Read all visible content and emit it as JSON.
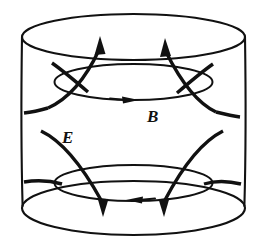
{
  "figure": {
    "background_color": "#ffffff",
    "stroke_color": "#111111",
    "width": 265,
    "height": 252
  },
  "labels": [
    {
      "id": "b-label",
      "text": "B",
      "meaning": "magnetic-field",
      "x": 147,
      "y": 122
    },
    {
      "id": "e-label",
      "text": "E",
      "meaning": "electric-field",
      "x": 62,
      "y": 143
    }
  ],
  "geometry": {
    "cylinder": {
      "center_x": 133.5,
      "left_wall_x": 22,
      "right_wall_x": 245,
      "top_ellipse": {
        "cx": 133.5,
        "cy": 37,
        "rx": 111.5,
        "ry": 23
      },
      "bottom_ellipse": {
        "cx": 133.5,
        "cy": 208,
        "rx": 111.5,
        "ry": 27
      }
    },
    "inner_rings": [
      {
        "id": "upper-b-loop",
        "cx": 133.5,
        "cy": 82,
        "rx": 79,
        "ry": 18,
        "arrow_direction": "right"
      },
      {
        "id": "lower-b-loop",
        "cx": 133.5,
        "cy": 183,
        "rx": 79,
        "ry": 18,
        "arrow_direction": "left"
      }
    ],
    "e_arrows_upper": [
      {
        "id": "e-arrow-upper-left",
        "tip_x": 100,
        "tip_y": 37,
        "direction": "up"
      },
      {
        "id": "e-arrow-upper-right",
        "tip_x": 166,
        "tip_y": 39,
        "direction": "up"
      }
    ],
    "e_arrows_lower": [
      {
        "id": "e-arrow-lower-left",
        "tip_x": 103,
        "tip_y": 215,
        "direction": "down"
      },
      {
        "id": "e-arrow-lower-right",
        "tip_x": 164,
        "tip_y": 215,
        "direction": "down"
      }
    ]
  }
}
